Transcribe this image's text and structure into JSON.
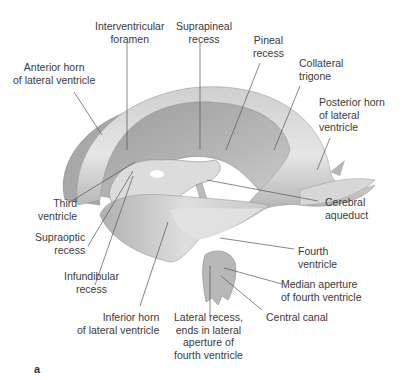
{
  "figure": {
    "panel_label": "a",
    "colors": {
      "cast_light": "#e2e2e2",
      "cast_mid": "#bdbdbd",
      "cast_dark": "#8e8e8e",
      "leader_line": "#555555",
      "text": "#3a3a3a"
    },
    "labels": [
      {
        "id": "interventricular-foramen",
        "text": "Interventricular\nforamen"
      },
      {
        "id": "suprapineal-recess",
        "text": "Suprapineal\nrecess"
      },
      {
        "id": "pineal-recess",
        "text": "Pineal\nrecess"
      },
      {
        "id": "anterior-horn",
        "text": "Anterior horn\nof lateral ventricle"
      },
      {
        "id": "collateral-trigone",
        "text": "Collateral\ntrigone"
      },
      {
        "id": "posterior-horn",
        "text": "Posterior horn\nof lateral\nventricle"
      },
      {
        "id": "third-ventricle",
        "text": "Third\nventricle"
      },
      {
        "id": "cerebral-aqueduct",
        "text": "Cerebral\naqueduct"
      },
      {
        "id": "supraoptic-recess",
        "text": "Supraoptic\nrecess"
      },
      {
        "id": "fourth-ventricle",
        "text": "Fourth\nventricle"
      },
      {
        "id": "infundibular-recess",
        "text": "Infundibular\nrecess"
      },
      {
        "id": "median-aperture",
        "text": "Median aperture\nof fourth ventricle"
      },
      {
        "id": "central-canal",
        "text": "Central canal"
      },
      {
        "id": "inferior-horn",
        "text": "Inferior horn\nof lateral ventricle"
      },
      {
        "id": "lateral-recess",
        "text": "Lateral recess,\nends in lateral\naperture of\nfourth ventricle"
      }
    ]
  }
}
